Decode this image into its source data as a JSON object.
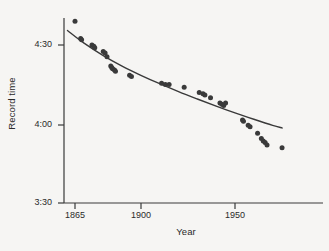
{
  "chart_data": {
    "type": "scatter",
    "title": "",
    "xlabel": "Year",
    "ylabel": "Record time",
    "xlim": [
      1861,
      1975
    ],
    "ylim": [
      210,
      285
    ],
    "xticks": [
      1865,
      1900,
      1950
    ],
    "xticklabels": [
      "1865",
      "1900",
      "1950"
    ],
    "yticks": [
      270,
      240,
      210
    ],
    "yticklabels": [
      "4:30",
      "4:00",
      "3:30"
    ],
    "grid": false,
    "legend": null,
    "y_unit": "seconds (displayed as minutes:seconds)",
    "point_color": "#3a3a3a",
    "line_color": "#3a3a3a",
    "series": [
      {
        "name": "Record time observations",
        "marker": "filled-circle",
        "x": [
          1865,
          1868,
          1868.5,
          1874,
          1875,
          1875.5,
          1880,
          1881,
          1882,
          1884,
          1884.5,
          1885,
          1886,
          1886.5,
          1894,
          1895,
          1911,
          1913,
          1915,
          1923,
          1931,
          1933,
          1934,
          1937,
          1942,
          1943,
          1944,
          1945,
          1954,
          1954.5,
          1957,
          1958,
          1962,
          1964,
          1965,
          1966,
          1967,
          1975
        ],
        "y": [
          279.0,
          272.5,
          272.0,
          270.0,
          269.5,
          269.0,
          267.5,
          267.0,
          265.5,
          262.0,
          261.5,
          261.0,
          260.5,
          260.0,
          258.5,
          258.0,
          255.5,
          255.0,
          255.0,
          254.0,
          252.0,
          251.5,
          251.0,
          250.0,
          248.0,
          247.5,
          247.0,
          248.0,
          241.5,
          241.0,
          239.5,
          239.0,
          236.5,
          234.5,
          233.5,
          233.0,
          232.0,
          231.0
        ]
      },
      {
        "name": "Fitted trend curve",
        "type": "line",
        "x": [
          1861,
          1870,
          1880,
          1890,
          1900,
          1910,
          1920,
          1930,
          1940,
          1950,
          1960,
          1970,
          1975
        ],
        "y": [
          275.5,
          270.6,
          266.0,
          262.0,
          258.5,
          255.3,
          252.3,
          249.5,
          246.8,
          244.2,
          241.8,
          239.5,
          238.5
        ]
      }
    ]
  },
  "axes": {
    "y": {
      "label": "Record time",
      "ticks": [
        {
          "label": "4:30",
          "px": 45
        },
        {
          "label": "4:00",
          "px": 125
        },
        {
          "label": "3:30",
          "px": 203
        }
      ]
    },
    "x": {
      "label": "Year",
      "ticks": [
        {
          "label": "1865",
          "px": 75
        },
        {
          "label": "1900",
          "px": 141
        },
        {
          "label": "1950",
          "px": 235
        }
      ]
    }
  },
  "colors": {
    "background": "#f6f5f3",
    "ink": "#3a3a3a",
    "text": "#2a2a2a"
  }
}
